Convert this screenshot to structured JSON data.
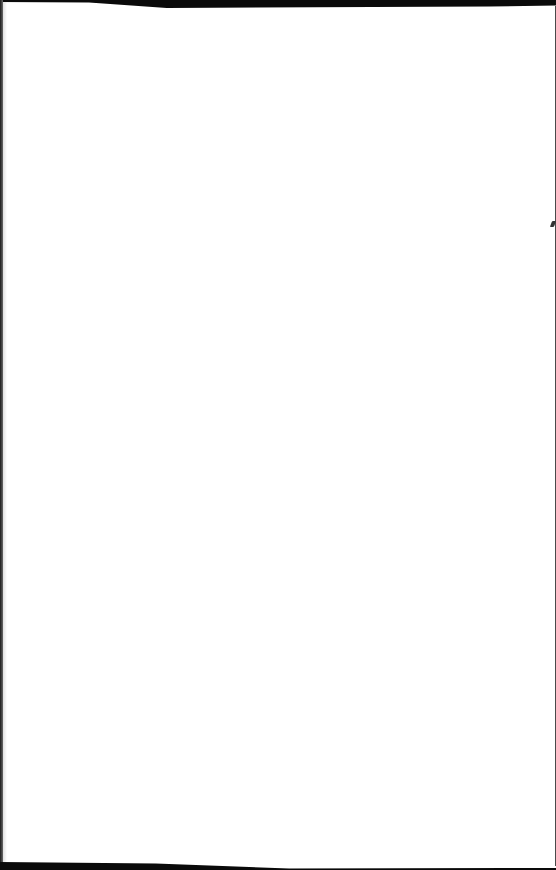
{
  "document": {
    "type": "blank scanned page",
    "content": "",
    "colors": {
      "paper": "#ffffff",
      "scan_border": "#0a0a0a"
    }
  }
}
